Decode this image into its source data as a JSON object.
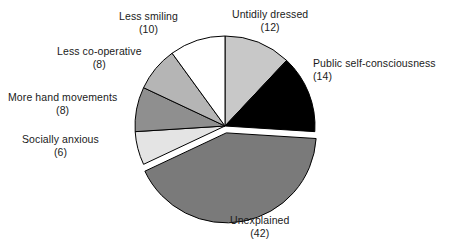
{
  "chart_data": {
    "type": "pie",
    "title": "",
    "subtitle": "",
    "xlabel": "",
    "ylabel": "",
    "legend_position": "labels-outside",
    "grid": false,
    "total": 100,
    "units": "count",
    "start_angle_deg": 0,
    "direction": "clockwise",
    "categories": [
      "Untidily dressed",
      "Public self-consciousness",
      "Unexplained",
      "Socially anxious",
      "More hand movements",
      "Less co-operative",
      "Less smiling"
    ],
    "values": [
      12,
      14,
      42,
      6,
      8,
      8,
      10
    ],
    "slices": [
      {
        "label": "Untidily dressed",
        "value": 12,
        "value_text": "(12)",
        "color": "#c8c8c8",
        "exploded": false,
        "start_deg": 0,
        "end_deg": 43.2
      },
      {
        "label": "Public self-consciousness",
        "value": 14,
        "value_text": "(14)",
        "color": "#000000",
        "exploded": false,
        "start_deg": 43.2,
        "end_deg": 93.6
      },
      {
        "label": "Unexplained",
        "value": 42,
        "value_text": "(42)",
        "color": "#7a7a7a",
        "exploded": true,
        "start_deg": 93.6,
        "end_deg": 244.8
      },
      {
        "label": "Socially anxious",
        "value": 6,
        "value_text": "(6)",
        "color": "#e4e4e4",
        "exploded": false,
        "start_deg": 244.8,
        "end_deg": 266.4
      },
      {
        "label": "More hand movements",
        "value": 8,
        "value_text": "(8)",
        "color": "#8f8f8f",
        "exploded": false,
        "start_deg": 266.4,
        "end_deg": 295.2
      },
      {
        "label": "Less co-operative",
        "value": 8,
        "value_text": "(8)",
        "color": "#b5b5b5",
        "exploded": false,
        "start_deg": 295.2,
        "end_deg": 324.0
      },
      {
        "label": "Less smiling",
        "value": 10,
        "value_text": "(10)",
        "color": "#ffffff",
        "exploded": false,
        "start_deg": 324.0,
        "end_deg": 360.0
      }
    ],
    "colors": {
      "outline": "#000000",
      "background": "#ffffff",
      "text": "#1a1a1a"
    }
  }
}
